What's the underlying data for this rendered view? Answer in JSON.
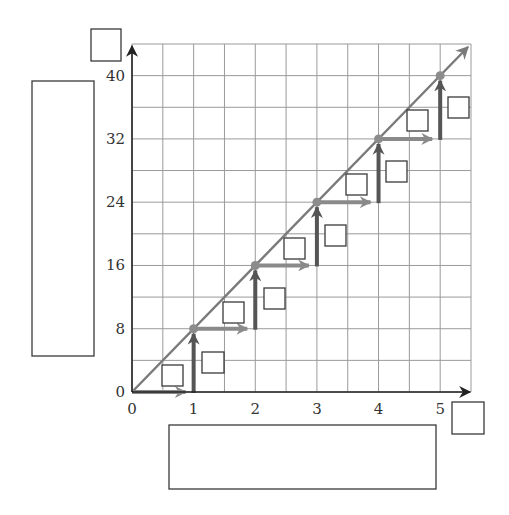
{
  "chart_data": {
    "type": "line",
    "title": "",
    "xlabel": "",
    "ylabel": "",
    "x": [
      0,
      1,
      2,
      3,
      4,
      5
    ],
    "series": [
      {
        "name": "y = 8x",
        "values": [
          0,
          8,
          16,
          24,
          32,
          40
        ]
      }
    ],
    "xlim": [
      0,
      5.5
    ],
    "ylim": [
      0,
      44
    ],
    "x_ticks": [
      "0",
      "1",
      "2",
      "3",
      "4",
      "5"
    ],
    "y_ticks": [
      "0",
      "8",
      "16",
      "24",
      "32",
      "40"
    ],
    "grid": true,
    "grid_minor_step": {
      "x": 0.5,
      "y": 4
    },
    "staircase": {
      "run": 1,
      "rise": 8,
      "steps": [
        {
          "from": [
            0,
            0
          ],
          "horizontal_to": [
            1,
            0
          ],
          "vertical_to": [
            1,
            8
          ]
        },
        {
          "from": [
            1,
            8
          ],
          "horizontal_to": [
            2,
            8
          ],
          "vertical_to": [
            2,
            16
          ]
        },
        {
          "from": [
            2,
            16
          ],
          "horizontal_to": [
            3,
            16
          ],
          "vertical_to": [
            3,
            24
          ]
        },
        {
          "from": [
            3,
            24
          ],
          "horizontal_to": [
            4,
            24
          ],
          "vertical_to": [
            4,
            32
          ]
        },
        {
          "from": [
            4,
            32
          ],
          "horizontal_to": [
            5,
            32
          ],
          "vertical_to": [
            5,
            40
          ]
        }
      ]
    },
    "annotations": "blank answer boxes for axis labels, run/rise values, and title"
  },
  "colors": {
    "grid": "#9a9a9a",
    "axis": "#222222",
    "line": "#7a7a7a",
    "arrow_run": "#8a8a8a",
    "arrow_rise": "#555555",
    "point": "#8c8c8c",
    "box_stroke": "#3a3a3a"
  },
  "blank_boxes": {
    "y_axis_label": {
      "x": 91,
      "y": 29,
      "w": 30,
      "h": 32
    },
    "x_axis_label": {
      "x": 452,
      "y": 402,
      "w": 32,
      "h": 32
    },
    "y_description": {
      "x": 32,
      "y": 81,
      "w": 62,
      "h": 275
    },
    "x_description": {
      "x": 169,
      "y": 425,
      "w": 267,
      "h": 64
    },
    "step_labels": [
      {
        "x": 162,
        "y": 365,
        "w": 21,
        "h": 21
      },
      {
        "x": 202,
        "y": 352,
        "w": 22,
        "h": 21
      },
      {
        "x": 223,
        "y": 302,
        "w": 21,
        "h": 21
      },
      {
        "x": 264,
        "y": 288,
        "w": 21,
        "h": 21
      },
      {
        "x": 284,
        "y": 238,
        "w": 21,
        "h": 21
      },
      {
        "x": 325,
        "y": 225,
        "w": 21,
        "h": 21
      },
      {
        "x": 346,
        "y": 174,
        "w": 21,
        "h": 21
      },
      {
        "x": 386,
        "y": 161,
        "w": 21,
        "h": 21
      },
      {
        "x": 407,
        "y": 110,
        "w": 21,
        "h": 21
      },
      {
        "x": 448,
        "y": 97,
        "w": 21,
        "h": 21
      }
    ]
  }
}
